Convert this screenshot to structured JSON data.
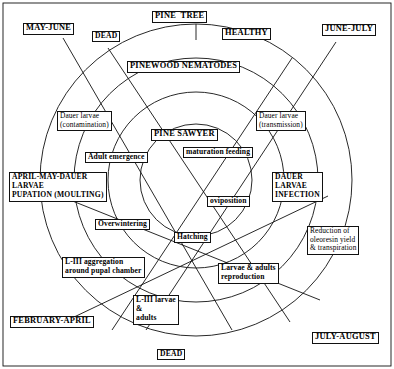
{
  "diagram": {
    "type": "cycle-diagram",
    "background_color": "#ffffff",
    "line_color": "#111111",
    "text_color": "#000000"
  },
  "nodes": {
    "pine_tree": "PINE  TREE",
    "healthy": "HEALTHY",
    "dead_top": "DEAD",
    "dead_bottom": "DEAD",
    "pinewood_nematodes": "PINEWOOD NEMATODES",
    "pine_sawyer": "PINE SAWYER",
    "dauer_contamination": "Dauer larvae\n(contamination)",
    "dauer_transmission": "Dauer larvae\n(transmission)",
    "adult_emergence": "Adult emergence",
    "maturation_feeding": "maturation feeding",
    "oviposition": "oviposition",
    "overwintering": "Overwintering",
    "hatching": "Hatching",
    "liii_aggregation": "L-III aggregation\naround pupal chamber",
    "liii_larvae_adults": "L-III larvae\n&\nadults",
    "larvae_adults_reproduction": "Larvae & adults\nreproduction",
    "reduction_oleoresin": "Reduction of\noleoresin yield\n& transpiration"
  },
  "seasons": {
    "may_june": "MAY-JUNE",
    "june_july": "JUNE-JULY",
    "april_may": "APRIL-MAY-DAUER\nLARVAE\nPUPATION (MOULTING)",
    "dauer_larvae_infection": "DAUER\nLARVAE\nINFECTION",
    "february_april": "FEBRUARY-APRIL",
    "july_august": "JULY-AUGUST"
  }
}
